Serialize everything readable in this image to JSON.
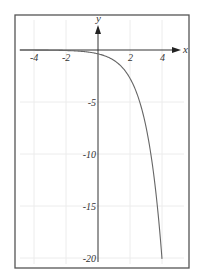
{
  "chart_data": {
    "type": "line",
    "title": "",
    "function": "y = -e^(x-1)",
    "xlabel": "x",
    "ylabel": "y",
    "xlim": [
      -5,
      5
    ],
    "ylim": [
      -20,
      2
    ],
    "x_ticks": [
      "-4",
      "-2",
      "2",
      "4"
    ],
    "y_ticks": [
      "-5",
      "-10",
      "-15",
      "-20"
    ],
    "grid": true,
    "legend": null,
    "series": [
      {
        "name": "curve",
        "x": [
          -5,
          -4,
          -3,
          -2,
          -1,
          0,
          1,
          1.5,
          2,
          2.5,
          3,
          3.25,
          3.5,
          3.75,
          4
        ],
        "y": [
          -0.02,
          -0.05,
          -0.14,
          -0.37,
          -1.0,
          -0.37,
          -1.0,
          -1.65,
          -2.72,
          -4.48,
          -7.39,
          -9.49,
          -12.18,
          -15.64,
          -20.09
        ]
      }
    ]
  },
  "axes": {
    "x_label": "x",
    "y_label": "y",
    "x_ticks": [
      {
        "label": "-4",
        "px": 34
      },
      {
        "label": "-2",
        "px": 66
      },
      {
        "label": "2",
        "px": 130
      },
      {
        "label": "4",
        "px": 162
      }
    ],
    "y_ticks": [
      {
        "label": "-5",
        "py": 102
      },
      {
        "label": "-10",
        "py": 154
      },
      {
        "label": "-15",
        "py": 206
      },
      {
        "label": "-20",
        "py": 258
      }
    ]
  },
  "colors": {
    "frame": "#555555",
    "axis": "#333333",
    "curve": "#666666",
    "grid": "#eeeeee"
  }
}
